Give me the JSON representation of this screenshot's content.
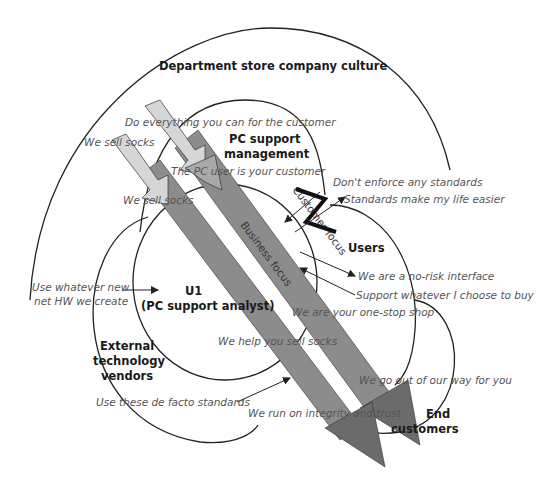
{
  "diagram": {
    "title": "Department store company culture",
    "nodes": [
      {
        "id": "culture",
        "label": "Department store company culture"
      },
      {
        "id": "pc_mgmt",
        "label_line1": "PC support",
        "label_line2": "management"
      },
      {
        "id": "users",
        "label": "Users"
      },
      {
        "id": "u1",
        "label_line1": "U1",
        "label_line2": "(PC support analyst)"
      },
      {
        "id": "vendors",
        "label_line1": "External",
        "label_line2": "technology",
        "label_line3": "vendors"
      },
      {
        "id": "end_customers",
        "label_line1": "End",
        "label_line2": "customers"
      }
    ],
    "bands": [
      {
        "id": "customer_focus",
        "label": "Customer focus"
      },
      {
        "id": "business_focus",
        "label": "Business focus"
      }
    ],
    "messages": {
      "do_everything": "Do everything you can for the customer",
      "we_sell_socks_1": "We sell socks",
      "we_sell_socks_2": "We sell socks",
      "pc_user_customer": "The PC user is your customer",
      "dont_enforce": "Don't enforce any standards",
      "standards_easier": "Standards make my life easier",
      "no_risk": "We are a no-risk interface",
      "support_whatever": "Support whatever I choose to buy",
      "one_stop": "We are your one-stop shop",
      "use_whatever_1": "Use whatever new",
      "use_whatever_2": "net HW we create",
      "help_sell": "We help you sell socks",
      "out_of_way": "We go out of our way for you",
      "defacto": "Use these de facto standards",
      "integrity": "We run on integrity and trust"
    },
    "colors": {
      "arrow_light": "#d6d6d6",
      "arrow_mid": "#a9a9a9",
      "arrow_dark": "#7a7a7a",
      "band": "#8c8c8c",
      "conflict": "#111111"
    }
  }
}
